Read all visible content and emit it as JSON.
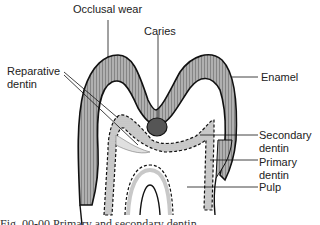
{
  "figure": {
    "labels": {
      "occlusal_wear": "Occlusal wear",
      "caries": "Caries",
      "reparative_dentin_line1": "Reparative",
      "reparative_dentin_line2": "dentin",
      "enamel": "Enamel",
      "secondary_dentin_line1": "Secondary",
      "secondary_dentin_line2": "dentin",
      "primary_dentin_line1": "Primary",
      "primary_dentin_line2": "dentin",
      "pulp": "Pulp"
    },
    "colors": {
      "enamel_fill": "#a9a9a9",
      "dentin_band_fill": "#c8c8c8",
      "caries_fill": "#555555",
      "outline": "#111111",
      "background": "#ffffff"
    },
    "caption_partial": "Fig. 00-00  Primary and secondary dentin ..."
  }
}
